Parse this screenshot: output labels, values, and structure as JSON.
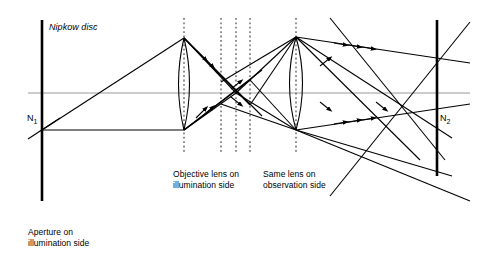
{
  "figure": {
    "type": "optical-ray-diagram",
    "title_text": "Nipkow disc",
    "labels": {
      "nipkow_disc": "Nipkow disc",
      "node_left": "N",
      "node_left_sub": "1",
      "node_right": "N",
      "node_right_sub": "2",
      "aperture": "Aperture on\nillumination side",
      "objective_lens": "Objective lens on\nillumination side",
      "same_lens": "Same lens on\nobservation side"
    },
    "colors": {
      "ink": "#000000",
      "axis": "#9a9a9a",
      "dashed": "#4d4d4d",
      "background": "#ffffff"
    },
    "elements": {
      "optical_axis_y": 93,
      "aperture_bar": {
        "x": 42,
        "y1": 20,
        "y2": 201,
        "width": 2.6
      },
      "screen_bar": {
        "x": 437,
        "y1": 20,
        "y2": 176,
        "width": 2.6
      },
      "lens_illumination": {
        "cx": 184,
        "top_y": 38,
        "bottom_y": 130,
        "bulge": 11
      },
      "lens_observation": {
        "cx": 296,
        "top_y": 37,
        "bottom_y": 130,
        "bulge": 13
      },
      "dashed_lines_x": [
        184,
        221,
        236,
        250,
        296
      ],
      "dashed_y_top": 18,
      "dashed_y_bottom": 152
    }
  }
}
